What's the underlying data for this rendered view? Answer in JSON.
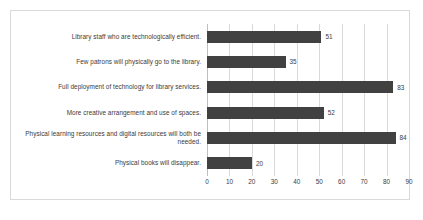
{
  "chart_data": {
    "type": "bar",
    "orientation": "horizontal",
    "title": "",
    "subtitle": "",
    "xlabel": "",
    "ylabel": "",
    "xlim": [
      0,
      90
    ],
    "xticks": [
      "0",
      "10",
      "20",
      "30",
      "40",
      "50",
      "60",
      "70",
      "80",
      "90"
    ],
    "grid": true,
    "legend": false,
    "bar_color": "#414141",
    "gridline_color": "#d9d9d9",
    "text_color": "#3a3a3a",
    "categories": [
      "Library staff who are technologically efficient.",
      "Few patrons will physically go to the library.",
      "Full deployment of technology for library services.",
      "More creative arrangement and use of spaces.",
      "Physical learning resources and digital resources will both be needed.",
      "Physical books will disappear."
    ],
    "values": [
      51,
      35,
      83,
      52,
      84,
      20
    ],
    "data_labels": [
      "51",
      "35",
      "83",
      "52",
      "84",
      "20"
    ]
  }
}
